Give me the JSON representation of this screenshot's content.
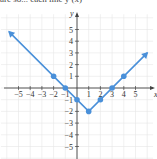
{
  "caption": "are so... each line y (x)",
  "chart_data": {
    "type": "line",
    "title": "",
    "xlabel": "x",
    "ylabel": "y",
    "xlim": [
      -6,
      6
    ],
    "ylim": [
      -6,
      6
    ],
    "grid": true,
    "x_ticks": [
      -5,
      -4,
      -3,
      -2,
      -1,
      1,
      2,
      3,
      4,
      5
    ],
    "y_ticks": [
      -5,
      -4,
      -3,
      -2,
      -1,
      1,
      2,
      3,
      4,
      5
    ],
    "series": [
      {
        "name": "y = |x - 1| - 2",
        "color": "#4a90d9",
        "line_x": [
          -5.8,
          1,
          6
        ],
        "line_y": [
          4.8,
          -2,
          3
        ],
        "points_x": [
          -2,
          -1,
          0,
          1,
          2,
          3,
          4
        ],
        "points_y": [
          1,
          0,
          -1,
          -2,
          -1,
          0,
          1
        ]
      }
    ]
  },
  "labels": {
    "x_axis": "x",
    "y_axis": "y",
    "x_ticks": [
      "−5",
      "−4",
      "−3",
      "−2",
      "−1",
      "1",
      "2",
      "3",
      "4",
      "5"
    ],
    "y_ticks": [
      "5",
      "4",
      "3",
      "2",
      "1",
      "−1",
      "−2",
      "−3",
      "−4",
      "−5"
    ]
  }
}
